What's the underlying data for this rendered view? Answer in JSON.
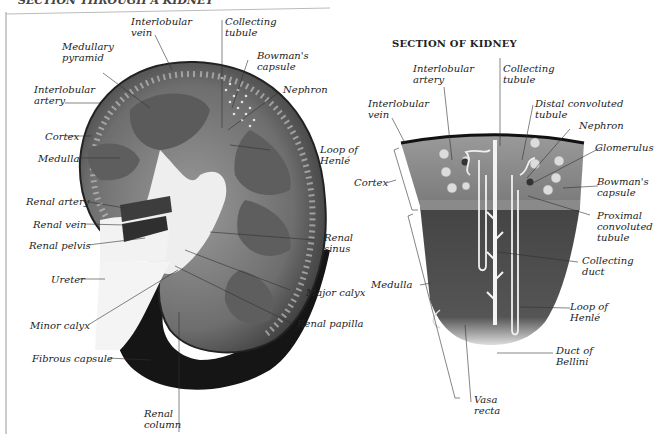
{
  "page": {
    "cut_heading": "SECTION THROUGH A KIDNEY",
    "colors": {
      "background": "#ffffff",
      "ink": "#222222",
      "tissue_dark": "#2a2a2a",
      "tissue_mid": "#7a7a7a",
      "tissue_light": "#c8c8c8"
    }
  },
  "left_diagram": {
    "labels": {
      "interlobular_vein": "Interlobular\nvein",
      "collecting_tubule": "Collecting\ntubule",
      "medullary_pyramid": "Medullary\npyramid",
      "bowmans_capsule": "Bowman's\ncapsule",
      "interlobular_artery": "Interlobular\nartery",
      "nephron": "Nephron",
      "cortex": "Cortex",
      "medulla": "Medulla",
      "loop_of_henle": "Loop of\nHenlé",
      "renal_artery": "Renal artery",
      "renal_vein": "Renal vein",
      "renal_pelvis": "Renal pelvis",
      "renal_sinus": "Renal\nsinus",
      "ureter": "Ureter",
      "major_calyx": "Major calyx",
      "minor_calyx": "Minor calyx",
      "renal_papilla": "Renal papilla",
      "fibrous_capsule": "Fibrous capsule",
      "renal_column": "Renal\ncolumn"
    }
  },
  "right_diagram": {
    "title": "SECTION OF KIDNEY",
    "labels": {
      "interlobular_artery": "Interlobular\nartery",
      "collecting_tubule": "Collecting\ntubule",
      "interlobular_vein": "Interlobular\nvein",
      "distal_convoluted_tubule": "Distal convoluted\ntubule",
      "nephron": "Nephron",
      "glomerulus": "Glomerulus",
      "cortex": "Cortex",
      "bowmans_capsule": "Bowman's\ncapsule",
      "proximal_convoluted_tubule": "Proximal\nconvoluted\ntubule",
      "medulla": "Medulla",
      "collecting_duct": "Collecting\nduct",
      "loop_of_henle": "Loop of\nHenlé",
      "duct_of_bellini": "Duct of\nBellini",
      "vasa_recta": "Vasa\nrecta"
    }
  }
}
